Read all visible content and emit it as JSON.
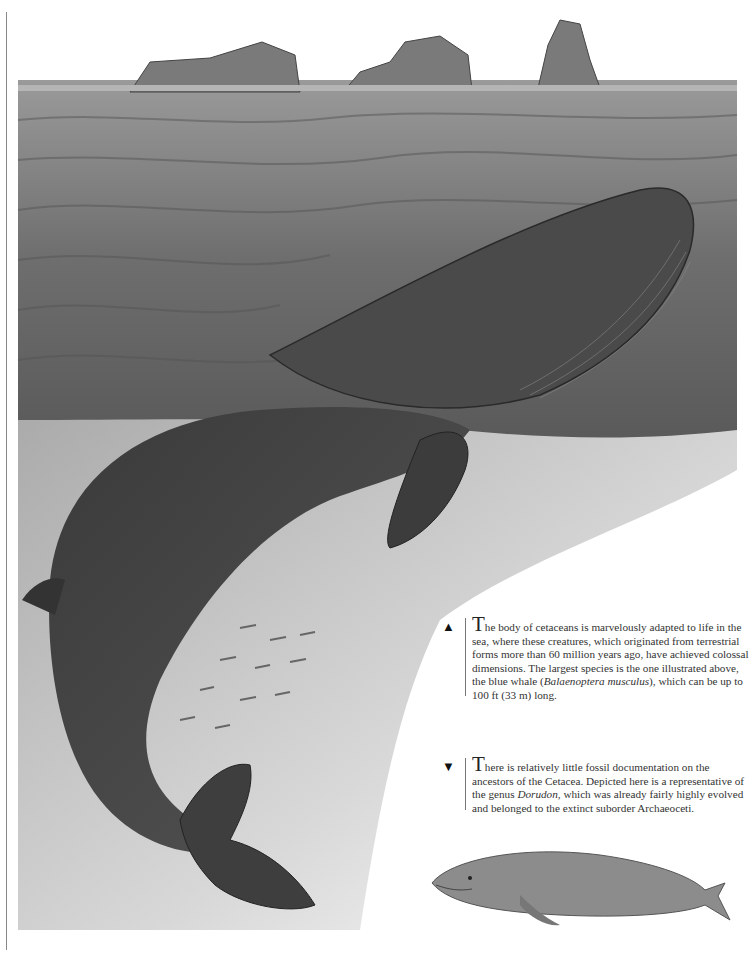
{
  "page": {
    "type": "illustrated book page",
    "illustration": {
      "main_subject": "blue whale breaching surface, body visible underwater",
      "background": "icebergs on horizon over choppy sea",
      "secondary_subject": "Dorudon (extinct archaeocete) illustration"
    }
  },
  "captions": [
    {
      "marker": "▲",
      "marker_icon": "triangle-up-icon",
      "dropcap": "T",
      "text_before_italic": "he body of cetaceans is marvelously adapted to life in the sea, where these creatures, which originated from terrestrial forms more than 60 million years ago, have achieved colossal dimensions. The largest species is the one illustrated above, the blue whale (",
      "italic": "Balaenoptera musculus",
      "text_after_italic": "), which can be up to 100 ft (33 m) long."
    },
    {
      "marker": "▼",
      "marker_icon": "triangle-down-icon",
      "dropcap": "T",
      "text_before_italic": "here is relatively little fossil documentation on the ancestors of the Cetacea. Depicted here is a representative of the genus ",
      "italic": "Dorudon",
      "text_after_italic": ", which was already fairly highly evolved and belonged to the extinct suborder Archaeoceti."
    }
  ]
}
